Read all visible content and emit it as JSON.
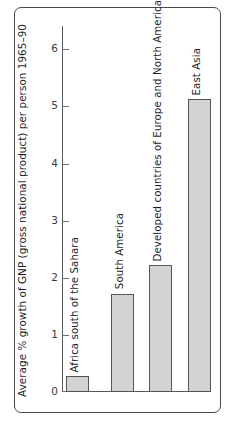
{
  "chart_data": {
    "type": "bar",
    "title": "",
    "xlabel": "",
    "ylabel": "Average % growth of GNP (gross national product) per person 1965–90",
    "categories": [
      "Africa south of the Sahara",
      "South America",
      "Developed countries of Europe and North America",
      "East Asia"
    ],
    "values": [
      0.28,
      1.72,
      2.22,
      5.12
    ],
    "ylim": [
      0,
      6.4
    ],
    "yticks": [
      0,
      1,
      2,
      3,
      4,
      5,
      6
    ],
    "ytick_labels": [
      "0",
      "1",
      "2",
      "3",
      "4",
      "5",
      "6"
    ],
    "grid": false,
    "legend": null,
    "bar_color": "#d3d3d3",
    "bar_edge_color": "#555555",
    "axis_color": "#55595c",
    "frame_color": "#4a4a4a",
    "text_color": "#1e1e1e"
  }
}
